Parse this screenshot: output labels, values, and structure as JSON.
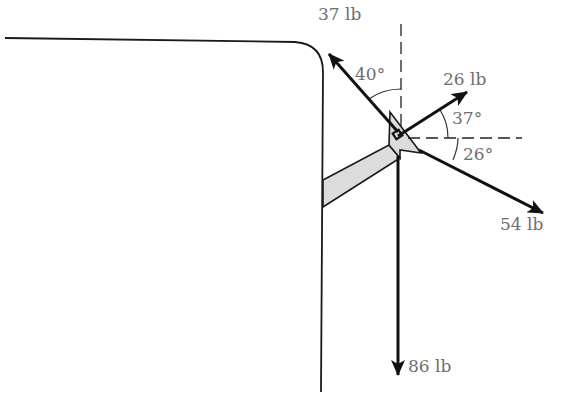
{
  "diagram": {
    "title": "",
    "forces": [
      {
        "id": "f37",
        "label": "37 lb",
        "magnitude": 37,
        "unit": "lb",
        "angle_label": "40°",
        "angle_deg": 40,
        "angle_reference": "vertical",
        "direction": "up-left"
      },
      {
        "id": "f26",
        "label": "26 lb",
        "magnitude": 26,
        "unit": "lb",
        "angle_label": "37°",
        "angle_deg": 37,
        "angle_reference": "horizontal",
        "direction": "up-right"
      },
      {
        "id": "f54",
        "label": "54 lb",
        "magnitude": 54,
        "unit": "lb",
        "angle_label": "26°",
        "angle_deg": 26,
        "angle_reference": "horizontal",
        "direction": "down-right"
      },
      {
        "id": "f86",
        "label": "86 lb",
        "magnitude": 86,
        "unit": "lb",
        "angle_label": "",
        "angle_deg": 90,
        "angle_reference": "vertical",
        "direction": "down"
      }
    ],
    "labels": {
      "f37": "37 lb",
      "f26": "26 lb",
      "f54": "54 lb",
      "f86": "86 lb",
      "a40": "40°",
      "a37": "37°",
      "a26": "26°"
    },
    "colors": {
      "stroke": "#111111",
      "bracket_fill": "#dcdcdc",
      "label_text": "#6e6e6e",
      "background": "#ffffff"
    }
  }
}
